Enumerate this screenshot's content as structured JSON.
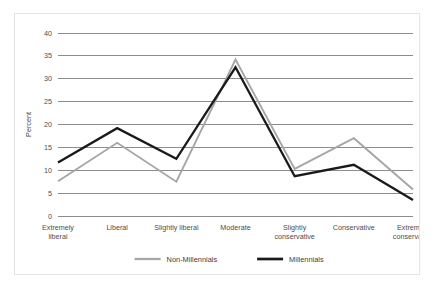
{
  "chart_data": {
    "type": "line",
    "title": "",
    "xlabel": "",
    "ylabel": "Percent",
    "ylim": [
      0,
      40
    ],
    "yticks": [
      0,
      5,
      10,
      15,
      20,
      25,
      30,
      35,
      40
    ],
    "grid": true,
    "legend_position": "bottom",
    "categories": [
      "Extremely liberal",
      "Liberal",
      "Slightly liberal",
      "Moderate",
      "Slightly conservative",
      "Conservative",
      "Extremely conservative"
    ],
    "category_lines": [
      [
        "Extremely",
        "liberal"
      ],
      [
        "Liberal"
      ],
      [
        "Slightly liberal"
      ],
      [
        "Moderate"
      ],
      [
        "Slightly",
        "conservative"
      ],
      [
        "Conservative"
      ],
      [
        "Extremely",
        "conservative"
      ]
    ],
    "series": [
      {
        "name": "Non-Millennials",
        "color": "#a6a6a6",
        "width": 1.9,
        "values": [
          7.6,
          16.0,
          7.5,
          34.2,
          10.3,
          17.0,
          5.8
        ]
      },
      {
        "name": "Millennials",
        "color": "#1a1a1a",
        "width": 2.3,
        "values": [
          11.7,
          19.2,
          12.5,
          32.5,
          8.7,
          11.2,
          3.5
        ]
      }
    ]
  },
  "figure": {
    "border_color": "#e3e3e3",
    "background": "#ffffff",
    "gridline_color": "#8c8c8c",
    "axis_label_color": "#4d4d4d"
  }
}
